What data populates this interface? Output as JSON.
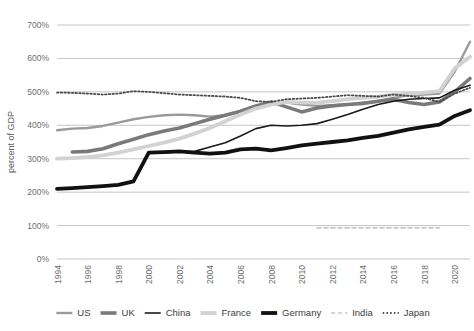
{
  "chart_data": {
    "type": "line",
    "title": "",
    "xlabel": "",
    "ylabel": "percent of GDP",
    "xlim": [
      1994,
      2021
    ],
    "ylim": [
      0,
      700
    ],
    "grid": true,
    "legend_position": "bottom",
    "ytick_labels": [
      "0%",
      "100%",
      "200%",
      "300%",
      "400%",
      "500%",
      "600%",
      "700%"
    ],
    "ytick_values": [
      0,
      100,
      200,
      300,
      400,
      500,
      600,
      700
    ],
    "xtick_labels": [
      "1994",
      "1996",
      "1998",
      "2000",
      "2002",
      "2004",
      "2006",
      "2008",
      "2010",
      "2012",
      "2014",
      "2016",
      "2018",
      "2020"
    ],
    "xtick_values": [
      1994,
      1996,
      1998,
      2000,
      2002,
      2004,
      2006,
      2008,
      2010,
      2012,
      2014,
      2016,
      2018,
      2020
    ],
    "series": [
      {
        "name": "US",
        "color": "#9a9a9a",
        "width": 2.4,
        "dash": "",
        "x": [
          1994,
          1995,
          1996,
          1997,
          1998,
          1999,
          2000,
          2001,
          2002,
          2003,
          2004,
          2005,
          2006,
          2007,
          2008,
          2009,
          2010,
          2011,
          2012,
          2013,
          2014,
          2015,
          2016,
          2017,
          2018,
          2019,
          2020,
          2021
        ],
        "values": [
          385,
          390,
          392,
          398,
          408,
          418,
          425,
          430,
          432,
          430,
          426,
          430,
          440,
          452,
          462,
          468,
          462,
          458,
          460,
          462,
          468,
          472,
          482,
          490,
          492,
          495,
          560,
          650
        ]
      },
      {
        "name": "UK",
        "color": "#7a7a7a",
        "width": 3.6,
        "dash": "",
        "x": [
          1995,
          1996,
          1997,
          1998,
          1999,
          2000,
          2001,
          2002,
          2003,
          2004,
          2005,
          2006,
          2007,
          2008,
          2009,
          2010,
          2011,
          2012,
          2013,
          2014,
          2015,
          2016,
          2017,
          2018,
          2019,
          2020,
          2021
        ],
        "values": [
          320,
          322,
          330,
          345,
          358,
          372,
          383,
          392,
          405,
          418,
          430,
          442,
          458,
          470,
          455,
          440,
          452,
          458,
          462,
          465,
          472,
          478,
          468,
          462,
          470,
          500,
          540
        ]
      },
      {
        "name": "China",
        "color": "#1a1a1a",
        "width": 1.6,
        "dash": "",
        "x": [
          2000,
          2001,
          2002,
          2003,
          2004,
          2005,
          2006,
          2007,
          2008,
          2009,
          2010,
          2011,
          2012,
          2013,
          2014,
          2015,
          2016,
          2017,
          2018,
          2019,
          2020,
          2021
        ],
        "values": [
          318,
          318,
          320,
          322,
          335,
          348,
          368,
          390,
          400,
          398,
          400,
          405,
          418,
          432,
          448,
          462,
          472,
          478,
          480,
          482,
          505,
          520
        ]
      },
      {
        "name": "France",
        "color": "#d2d2d2",
        "width": 3.8,
        "dash": "",
        "x": [
          1994,
          1995,
          1996,
          1997,
          1998,
          1999,
          2000,
          2001,
          2002,
          2003,
          2004,
          2005,
          2006,
          2007,
          2008,
          2009,
          2010,
          2011,
          2012,
          2013,
          2014,
          2015,
          2016,
          2017,
          2018,
          2019,
          2020,
          2021
        ],
        "values": [
          300,
          302,
          305,
          310,
          318,
          328,
          338,
          348,
          360,
          375,
          392,
          412,
          432,
          450,
          462,
          470,
          468,
          468,
          472,
          478,
          482,
          486,
          492,
          495,
          498,
          502,
          570,
          605
        ]
      },
      {
        "name": "Germany",
        "color": "#111111",
        "width": 3.8,
        "dash": "",
        "x": [
          1994,
          1995,
          1996,
          1997,
          1998,
          1999,
          2000,
          2001,
          2002,
          2003,
          2004,
          2005,
          2006,
          2007,
          2008,
          2009,
          2010,
          2011,
          2012,
          2013,
          2014,
          2015,
          2016,
          2017,
          2018,
          2019,
          2020,
          2021
        ],
        "values": [
          210,
          212,
          215,
          218,
          222,
          232,
          318,
          320,
          322,
          318,
          315,
          318,
          328,
          330,
          325,
          332,
          340,
          345,
          350,
          355,
          362,
          368,
          378,
          388,
          395,
          402,
          428,
          445
        ]
      },
      {
        "name": "India",
        "color": "#c8c8c8",
        "width": 1.6,
        "dash": "4,3",
        "x": [
          2011,
          2012,
          2013,
          2014,
          2015,
          2016,
          2017,
          2018,
          2019
        ],
        "values": [
          93,
          93,
          93,
          93,
          93,
          93,
          93,
          93,
          93
        ]
      },
      {
        "name": "Japan",
        "color": "#4a4a4a",
        "width": 1.8,
        "dash": "1.5,2.2",
        "x": [
          1994,
          1995,
          1996,
          1997,
          1998,
          1999,
          2000,
          2001,
          2002,
          2003,
          2004,
          2005,
          2006,
          2007,
          2008,
          2009,
          2010,
          2011,
          2012,
          2013,
          2014,
          2015,
          2016,
          2017,
          2018,
          2019,
          2020,
          2021
        ],
        "values": [
          498,
          497,
          495,
          492,
          495,
          502,
          500,
          496,
          492,
          490,
          488,
          486,
          482,
          472,
          470,
          478,
          480,
          482,
          486,
          490,
          488,
          486,
          492,
          488,
          482,
          470,
          495,
          512
        ]
      }
    ]
  },
  "legend": {
    "items": [
      {
        "label": "US"
      },
      {
        "label": "UK"
      },
      {
        "label": "China"
      },
      {
        "label": "France"
      },
      {
        "label": "Germany"
      },
      {
        "label": "India"
      },
      {
        "label": "Japan"
      }
    ]
  }
}
